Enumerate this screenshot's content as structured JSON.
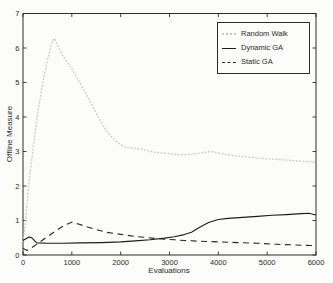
{
  "figure": {
    "background": "#fcfcfa",
    "axis_color": "#2b2b2b",
    "text_color": "#2a2a2a"
  },
  "chart_data": {
    "type": "line",
    "title": "",
    "xlabel": "Evaluations",
    "ylabel": "Offline Measure",
    "xlim": [
      0,
      6000
    ],
    "ylim": [
      0,
      7
    ],
    "xticks": [
      0,
      1000,
      2000,
      3000,
      4000,
      5000,
      6000
    ],
    "yticks": [
      0,
      1,
      2,
      3,
      4,
      5,
      6,
      7
    ],
    "grid": false,
    "legend_position": "top-right",
    "axis_color": "#2b2b2b",
    "series": [
      {
        "name": "Random Walk",
        "style": "dotted",
        "color": "#c6c6c6",
        "points": [
          [
            0,
            0.4
          ],
          [
            50,
            0.9
          ],
          [
            100,
            1.8
          ],
          [
            150,
            2.45
          ],
          [
            200,
            3.0
          ],
          [
            300,
            4.1
          ],
          [
            400,
            4.95
          ],
          [
            500,
            5.65
          ],
          [
            580,
            6.1
          ],
          [
            640,
            6.28
          ],
          [
            720,
            6.05
          ],
          [
            800,
            5.8
          ],
          [
            900,
            5.6
          ],
          [
            1000,
            5.4
          ],
          [
            1100,
            5.15
          ],
          [
            1200,
            4.9
          ],
          [
            1300,
            4.65
          ],
          [
            1400,
            4.4
          ],
          [
            1500,
            4.1
          ],
          [
            1600,
            3.85
          ],
          [
            1700,
            3.62
          ],
          [
            1800,
            3.45
          ],
          [
            1900,
            3.3
          ],
          [
            2000,
            3.2
          ],
          [
            2100,
            3.12
          ],
          [
            2250,
            3.1
          ],
          [
            2400,
            3.08
          ],
          [
            2550,
            3.02
          ],
          [
            2700,
            2.98
          ],
          [
            2900,
            2.95
          ],
          [
            3100,
            2.92
          ],
          [
            3300,
            2.9
          ],
          [
            3500,
            2.93
          ],
          [
            3700,
            2.97
          ],
          [
            3850,
            3.0
          ],
          [
            4000,
            2.96
          ],
          [
            4200,
            2.9
          ],
          [
            4400,
            2.87
          ],
          [
            4600,
            2.84
          ],
          [
            4800,
            2.81
          ],
          [
            5000,
            2.79
          ],
          [
            5200,
            2.77
          ],
          [
            5400,
            2.75
          ],
          [
            5600,
            2.73
          ],
          [
            5800,
            2.71
          ],
          [
            6000,
            2.68
          ]
        ]
      },
      {
        "name": "Dynamic GA",
        "style": "solid",
        "color": "#1c1c1c",
        "points": [
          [
            0,
            0.42
          ],
          [
            120,
            0.52
          ],
          [
            180,
            0.5
          ],
          [
            280,
            0.35
          ],
          [
            500,
            0.34
          ],
          [
            800,
            0.34
          ],
          [
            1200,
            0.35
          ],
          [
            1600,
            0.36
          ],
          [
            2000,
            0.38
          ],
          [
            2300,
            0.41
          ],
          [
            2600,
            0.44
          ],
          [
            2900,
            0.49
          ],
          [
            3100,
            0.53
          ],
          [
            3300,
            0.59
          ],
          [
            3450,
            0.66
          ],
          [
            3600,
            0.79
          ],
          [
            3800,
            0.94
          ],
          [
            4000,
            1.03
          ],
          [
            4200,
            1.06
          ],
          [
            4500,
            1.09
          ],
          [
            4800,
            1.12
          ],
          [
            5100,
            1.15
          ],
          [
            5400,
            1.17
          ],
          [
            5700,
            1.2
          ],
          [
            5850,
            1.21
          ],
          [
            6000,
            1.16
          ]
        ]
      },
      {
        "name": "Static GA",
        "style": "dashed",
        "color": "#262626",
        "points": [
          [
            0,
            0.2
          ],
          [
            80,
            0.13
          ],
          [
            150,
            0.18
          ],
          [
            300,
            0.33
          ],
          [
            500,
            0.53
          ],
          [
            700,
            0.73
          ],
          [
            850,
            0.86
          ],
          [
            1000,
            0.95
          ],
          [
            1150,
            0.89
          ],
          [
            1300,
            0.82
          ],
          [
            1500,
            0.74
          ],
          [
            1700,
            0.66
          ],
          [
            1900,
            0.62
          ],
          [
            2100,
            0.58
          ],
          [
            2300,
            0.54
          ],
          [
            2500,
            0.51
          ],
          [
            2700,
            0.48
          ],
          [
            2900,
            0.46
          ],
          [
            3100,
            0.44
          ],
          [
            3300,
            0.42
          ],
          [
            3600,
            0.4
          ],
          [
            4000,
            0.38
          ],
          [
            4400,
            0.36
          ],
          [
            4800,
            0.34
          ],
          [
            5200,
            0.31
          ],
          [
            5600,
            0.29
          ],
          [
            6000,
            0.27
          ]
        ]
      }
    ]
  },
  "legend": {
    "items": [
      {
        "label": "Random Walk"
      },
      {
        "label": "Dynamic GA"
      },
      {
        "label": "Static GA"
      }
    ]
  }
}
